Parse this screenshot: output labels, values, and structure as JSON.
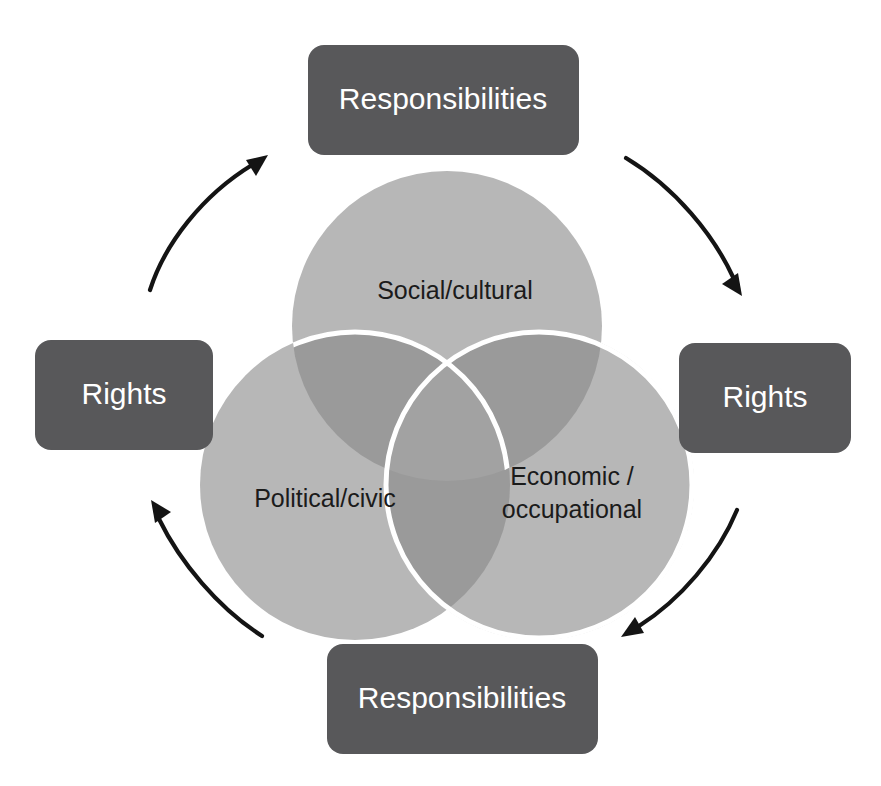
{
  "diagram": {
    "background_color": "#ffffff",
    "node_fill_color": "#58585a",
    "node_text_color": "#ffffff",
    "circle_fill_color": "#b7b7b7",
    "circle_overlap_color": "#9a9a9a",
    "circle_center_color": "#a0a0a0",
    "circle_outline_color": "#ffffff",
    "arrow_color": "#141414",
    "venn_label_color": "#1b1b1b"
  },
  "venn": {
    "type": "three-circle-venn",
    "circles": [
      {
        "id": "social",
        "label": "Social/cultural",
        "position": "top"
      },
      {
        "id": "political",
        "label": "Political/civic",
        "position": "bottom-left"
      },
      {
        "id": "economic",
        "label_line1": "Economic /",
        "label_line2": "occupational",
        "position": "bottom-right"
      }
    ]
  },
  "nodes": [
    {
      "id": "top",
      "label": "Responsibilities",
      "position": "top"
    },
    {
      "id": "right",
      "label": "Rights",
      "position": "right"
    },
    {
      "id": "bottom",
      "label": "Responsibilities",
      "position": "bottom"
    },
    {
      "id": "left",
      "label": "Rights",
      "position": "left"
    }
  ],
  "arrows": [
    {
      "id": "left-to-top",
      "from": "left",
      "to": "top",
      "direction": "clockwise",
      "icon": "curved-arrow-icon"
    },
    {
      "id": "top-to-right",
      "from": "top",
      "to": "right",
      "direction": "clockwise",
      "icon": "curved-arrow-icon"
    },
    {
      "id": "right-to-bottom",
      "from": "right",
      "to": "bottom",
      "direction": "clockwise",
      "icon": "curved-arrow-icon"
    },
    {
      "id": "bottom-to-left",
      "from": "bottom",
      "to": "left",
      "direction": "clockwise",
      "icon": "curved-arrow-icon"
    }
  ]
}
